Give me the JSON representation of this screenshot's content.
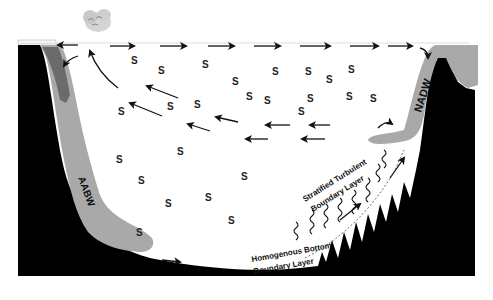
{
  "diagram": {
    "labels": {
      "aabw": "AABW",
      "nadw": "NADW",
      "stratified_line1": "Stratified Turbulent",
      "stratified_line2": "Boundary Layer",
      "homogenous_line1": "Homogenous Bottom",
      "homogenous_line2": "Boundary Layer"
    },
    "s_symbol": "S",
    "icons": [
      "cloud-icon"
    ],
    "colors": {
      "seafloor": "#000000",
      "water_mass": "#a9a9a9",
      "water_mass_dark": "#6b6b6b",
      "arrow": "#111111",
      "background": "#ffffff"
    }
  }
}
